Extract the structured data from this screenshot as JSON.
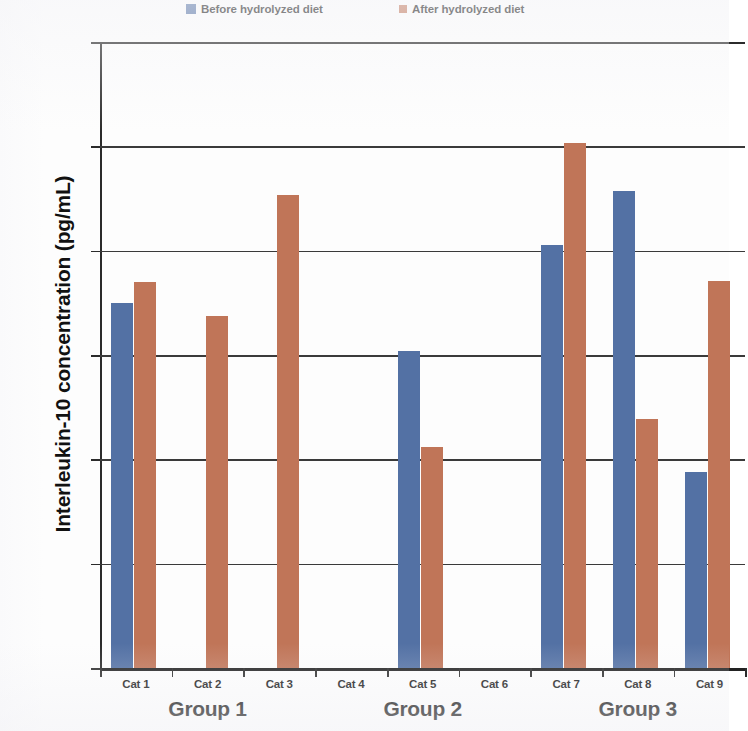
{
  "legend": {
    "entries": [
      {
        "label": "Before hydrolyzed diet",
        "color": "#5371a4",
        "icon": "legend-swatch-before"
      },
      {
        "label": "After hydrolyzed diet",
        "color": "#c07558",
        "icon": "legend-swatch-after"
      }
    ]
  },
  "axes": {
    "y_title": "Interleukin-10 concentration (pg/mL)",
    "y_ticks": [
      "0",
      "100",
      "200",
      "300",
      "400",
      "500",
      "600"
    ]
  },
  "groups": [
    {
      "label": "Group 1"
    },
    {
      "label": "Group 2"
    },
    {
      "label": "Group 3"
    }
  ],
  "categories": [
    "Cat 1",
    "Cat 2",
    "Cat 3",
    "Cat 4",
    "Cat 5",
    "Cat 6",
    "Cat 7",
    "Cat 8",
    "Cat 9"
  ],
  "chart_data": {
    "type": "bar",
    "title": "",
    "xlabel": "",
    "ylabel": "Interleukin-10 concentration (pg/mL)",
    "ylim": [
      0,
      600
    ],
    "ytick_step": 100,
    "grid": true,
    "legend_position": "top",
    "categories": [
      "Cat 1",
      "Cat 2",
      "Cat 3",
      "Cat 4",
      "Cat 5",
      "Cat 6",
      "Cat 7",
      "Cat 8",
      "Cat 9"
    ],
    "group_spans": [
      {
        "name": "Group 1",
        "categories": [
          "Cat 1",
          "Cat 2",
          "Cat 3"
        ]
      },
      {
        "name": "Group 2",
        "categories": [
          "Cat 4",
          "Cat 5",
          "Cat 6"
        ]
      },
      {
        "name": "Group 3",
        "categories": [
          "Cat 7",
          "Cat 8",
          "Cat 9"
        ]
      }
    ],
    "series": [
      {
        "name": "Before hydrolyzed diet",
        "color": "#5371a4",
        "values": [
          350,
          0,
          0,
          0,
          304,
          0,
          405,
          457,
          188
        ]
      },
      {
        "name": "After hydrolyzed diet",
        "color": "#c07558",
        "values": [
          370,
          337,
          453,
          0,
          212,
          0,
          503,
          239,
          371
        ]
      }
    ]
  },
  "bar_layout": {
    "slot_width": 71.7,
    "slot_start": 0,
    "bar_width": 22,
    "before_offset": 11,
    "after_offset": 34
  }
}
